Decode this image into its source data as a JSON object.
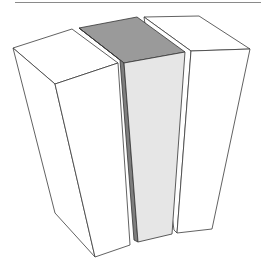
{
  "figure": {
    "colors": {
      "background": "#ffffff",
      "rule_line": "#8a8a8a",
      "outline": "#3a3a3a",
      "white_face": "#ffffff",
      "middle_top": "#9a9a9a",
      "middle_side": "#7e7e7e",
      "middle_front": "#e6e6e6"
    },
    "blocks": [
      {
        "name": "left-block",
        "highlighted": false
      },
      {
        "name": "middle-block",
        "highlighted": true
      },
      {
        "name": "right-block",
        "highlighted": false
      }
    ]
  }
}
